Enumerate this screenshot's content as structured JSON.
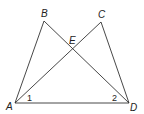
{
  "figure": {
    "points": {
      "A": {
        "label": "A",
        "x": 15,
        "y": 103
      },
      "B": {
        "label": "B",
        "x": 44,
        "y": 21
      },
      "C": {
        "label": "C",
        "x": 101,
        "y": 22
      },
      "D": {
        "label": "D",
        "x": 129,
        "y": 103
      },
      "E": {
        "label": "E",
        "x": 72,
        "y": 49
      }
    },
    "segments": [
      {
        "from": "A",
        "to": "B"
      },
      {
        "from": "B",
        "to": "D"
      },
      {
        "from": "A",
        "to": "C"
      },
      {
        "from": "C",
        "to": "D"
      },
      {
        "from": "A",
        "to": "D"
      }
    ],
    "labels": {
      "A": "A",
      "B": "B",
      "C": "C",
      "D": "D",
      "E": "E",
      "angle1": "1",
      "angle2": "2"
    }
  }
}
